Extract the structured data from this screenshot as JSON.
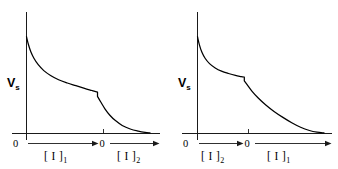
{
  "figure": {
    "background_color": "#ffffff",
    "line_color": "#000000",
    "width": 338,
    "height": 169
  },
  "chart_data": [
    {
      "type": "line",
      "panel_id": "left",
      "title": "",
      "xlabel": "",
      "ylabel": "Vs",
      "ylabel_text": "V",
      "ylabel_subscript": "s",
      "grid": false,
      "legend": "none",
      "origin_label": "0",
      "midpoint_label": "0",
      "segments": [
        {
          "name": "[ I ]1",
          "base": "[ I ]",
          "subscript": "1",
          "order": 1
        },
        {
          "name": "[ I ]2",
          "base": "[ I ]",
          "subscript": "2",
          "order": 2
        }
      ],
      "axis_note": "x-axis split into two titration ranges separated by a mid zero",
      "xlim": [
        0,
        1
      ],
      "ylim": [
        0,
        1
      ],
      "break_point": {
        "x": 0.575,
        "y": 0.38
      },
      "x": [
        0.0,
        0.015,
        0.035,
        0.06,
        0.095,
        0.14,
        0.195,
        0.26,
        0.33,
        0.4,
        0.47,
        0.53,
        0.575,
        0.575,
        0.6,
        0.635,
        0.675,
        0.72,
        0.775,
        0.84,
        0.905,
        0.96,
        1.0
      ],
      "y": [
        0.9,
        0.83,
        0.76,
        0.7,
        0.64,
        0.585,
        0.54,
        0.5,
        0.47,
        0.445,
        0.42,
        0.4,
        0.385,
        0.345,
        0.295,
        0.23,
        0.17,
        0.12,
        0.075,
        0.042,
        0.022,
        0.01,
        0.005
      ]
    },
    {
      "type": "line",
      "panel_id": "right",
      "title": "",
      "xlabel": "",
      "ylabel": "Vs",
      "ylabel_text": "V",
      "ylabel_subscript": "s",
      "grid": false,
      "legend": "none",
      "origin_label": "0",
      "midpoint_label": "0",
      "segments": [
        {
          "name": "[ I ]2",
          "base": "[ I ]",
          "subscript": "2",
          "order": 1
        },
        {
          "name": "[ I ]1",
          "base": "[ I ]",
          "subscript": "1",
          "order": 2
        }
      ],
      "axis_note": "x-axis split into two titration ranges separated by a mid zero",
      "xlim": [
        0,
        1
      ],
      "ylim": [
        0,
        1
      ],
      "break_point": {
        "x": 0.37,
        "y": 0.525
      },
      "x": [
        0.0,
        0.015,
        0.035,
        0.06,
        0.095,
        0.14,
        0.19,
        0.245,
        0.3,
        0.345,
        0.37,
        0.37,
        0.395,
        0.43,
        0.48,
        0.54,
        0.605,
        0.675,
        0.745,
        0.815,
        0.885,
        0.945,
        1.0
      ],
      "y": [
        0.9,
        0.825,
        0.755,
        0.7,
        0.65,
        0.61,
        0.58,
        0.558,
        0.54,
        0.53,
        0.525,
        0.49,
        0.45,
        0.395,
        0.33,
        0.265,
        0.205,
        0.15,
        0.1,
        0.058,
        0.028,
        0.012,
        0.005
      ]
    }
  ],
  "panels": {
    "left": {
      "y_axis_label_main": "V",
      "y_axis_label_sub": "s",
      "origin_zero": "0",
      "mid_zero": "0",
      "range_left_base": "[ I ]",
      "range_left_sub": "1",
      "range_right_base": "[ I ]",
      "range_right_sub": "2"
    },
    "right": {
      "y_axis_label_main": "V",
      "y_axis_label_sub": "s",
      "origin_zero": "0",
      "mid_zero": "0",
      "range_left_base": "[ I ]",
      "range_left_sub": "2",
      "range_right_base": "[ I ]",
      "range_right_sub": "1"
    }
  }
}
